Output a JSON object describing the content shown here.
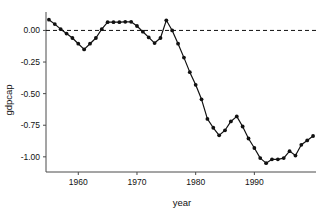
{
  "chart_data": {
    "type": "line",
    "title": "",
    "xlabel": "year",
    "ylabel": "gdpcap",
    "xlim": [
      1954.5,
      2000.5
    ],
    "ylim": [
      -1.12,
      0.13
    ],
    "grid": false,
    "legend": null,
    "xticks": [
      1960,
      1970,
      1980,
      1990
    ],
    "xtick_labels": [
      "1960",
      "1970",
      "1980",
      "1990"
    ],
    "yticks": [
      0.0,
      -0.25,
      -0.5,
      -0.75,
      -1.0
    ],
    "ytick_labels": [
      "0.00",
      "-0.25",
      "-0.50",
      "-0.75",
      "-1.00"
    ],
    "annotations": [
      {
        "type": "hline",
        "y": 0.0,
        "style": "dashed",
        "color": "#111111"
      }
    ],
    "series": [
      {
        "name": "gdpcap",
        "marker": "filled-circle",
        "color": "#111111",
        "x": [
          1955,
          1956,
          1957,
          1958,
          1959,
          1960,
          1961,
          1962,
          1963,
          1964,
          1965,
          1966,
          1967,
          1968,
          1969,
          1970,
          1971,
          1972,
          1973,
          1974,
          1975,
          1976,
          1977,
          1978,
          1979,
          1980,
          1981,
          1982,
          1983,
          1984,
          1985,
          1986,
          1987,
          1988,
          1989,
          1990,
          1991,
          1992,
          1993,
          1994,
          1995,
          1996,
          1997,
          1998,
          1999,
          2000
        ],
        "y": [
          0.085,
          0.05,
          0.01,
          -0.025,
          -0.06,
          -0.105,
          -0.15,
          -0.105,
          -0.06,
          0.01,
          0.065,
          0.065,
          0.065,
          0.068,
          0.068,
          0.035,
          -0.01,
          -0.055,
          -0.1,
          -0.06,
          0.08,
          0.0,
          -0.105,
          -0.215,
          -0.33,
          -0.43,
          -0.545,
          -0.7,
          -0.77,
          -0.83,
          -0.79,
          -0.72,
          -0.68,
          -0.76,
          -0.855,
          -0.93,
          -1.01,
          -1.05,
          -1.02,
          -1.02,
          -1.01,
          -0.955,
          -0.99,
          -0.905,
          -0.87,
          -0.835
        ]
      }
    ]
  },
  "axis": {
    "y_title": "gdpcap",
    "x_title": "year"
  }
}
